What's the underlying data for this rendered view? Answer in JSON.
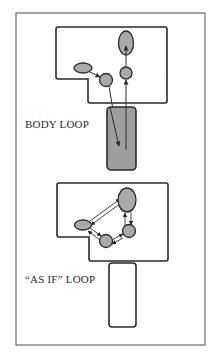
{
  "figure": {
    "colors": {
      "stroke": "#2a2a2a",
      "node_fill": "#a9a9a9",
      "body_fill": "#9e9e9e",
      "background": "#ffffff",
      "frame": "#6a6a6a"
    },
    "panels": [
      {
        "id": "body-loop",
        "label": "BODY LOOP",
        "brain_region": "brain outline with notch",
        "nodes": [
          "small-ellipse",
          "left-circle",
          "right-circle",
          "top-ellipse"
        ],
        "body": {
          "filled": true
        },
        "arrows": [
          "small-ellipse -> left-circle",
          "left-circle -> body",
          "body -> right-circle",
          "right-circle -> top-ellipse"
        ]
      },
      {
        "id": "as-if-loop",
        "label": "“AS IF” LOOP",
        "brain_region": "brain outline with notch",
        "nodes": [
          "small-ellipse",
          "bottom-circle",
          "right-circle",
          "top-ellipse"
        ],
        "body": {
          "filled": false
        },
        "arrows": [
          "small-ellipse <-> top-ellipse",
          "small-ellipse <-> bottom-circle",
          "bottom-circle <-> right-circle",
          "right-circle <-> top-ellipse"
        ]
      }
    ]
  }
}
